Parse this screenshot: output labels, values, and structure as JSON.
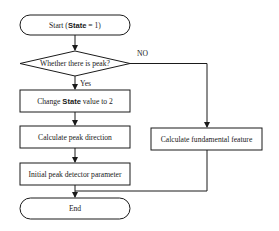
{
  "flowchart": {
    "start": {
      "prefix": "Start (",
      "keyword": "State",
      "suffix": " = 1)"
    },
    "decision": {
      "label": "Whether there is peak?",
      "yes_label": "Yes",
      "no_label": "NO"
    },
    "change_state": {
      "prefix": "Change ",
      "keyword": "State",
      "suffix": " value to 2"
    },
    "calc_direction": {
      "label": "Calculate peak direction"
    },
    "init_param": {
      "label": "Initial peak detector parameter"
    },
    "fundamental": {
      "label": "Calculate fundamental  feature"
    },
    "end": {
      "label": "End"
    }
  },
  "colors": {
    "stroke": "#1a1a1a",
    "background": "#ffffff"
  }
}
